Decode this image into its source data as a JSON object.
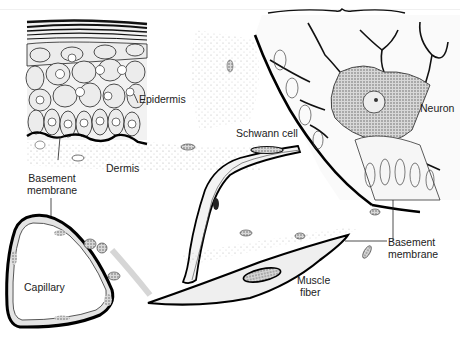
{
  "diagram": {
    "type": "anatomical illustration",
    "structures": [
      "epidermis",
      "dermis",
      "capillary",
      "nerve with Schwann cell",
      "neuron",
      "muscle fiber"
    ],
    "labels": {
      "epidermis": "Epidermis",
      "dermis": "Dermis",
      "basement_membrane_left_line1": "Basement",
      "basement_membrane_left_line2": "membrane",
      "capillary": "Capillary",
      "schwann_cell": "Schwann cell",
      "neuron": "Neuron",
      "basement_membrane_right_line1": "Basement",
      "basement_membrane_right_line2": "membrane",
      "muscle_fiber_line1": "Muscle",
      "muscle_fiber_line2": "fiber"
    },
    "colors": {
      "ink": "#111111",
      "cell_fill": "#e6e6e6",
      "stipple": "#bdbdbd",
      "background": "#ffffff"
    }
  }
}
